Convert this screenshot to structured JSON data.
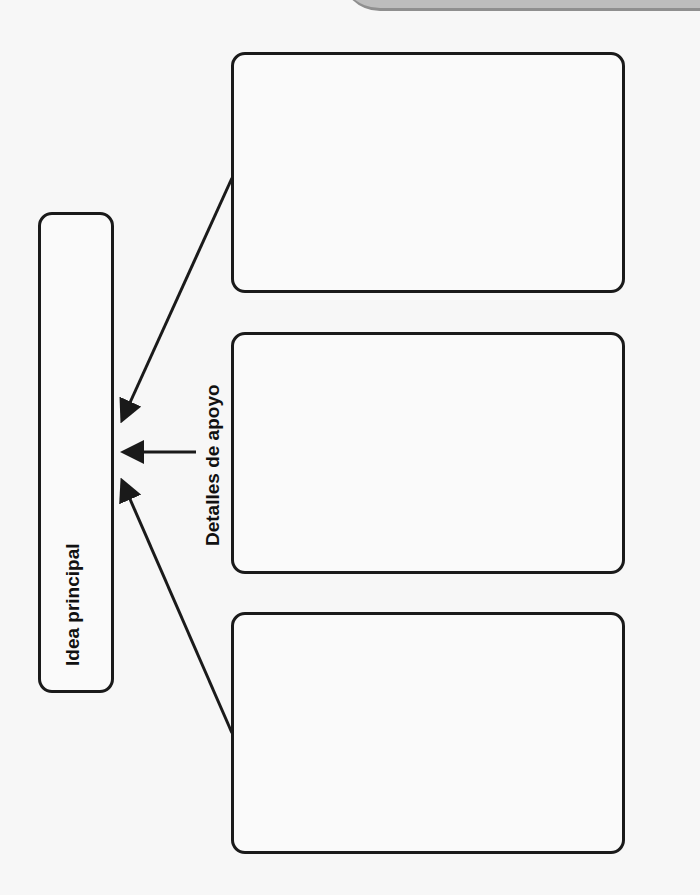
{
  "diagram": {
    "main_idea_label": "Idea principal",
    "details_label": "Detalles de apoyo",
    "detail_boxes": [
      {
        "id": 1,
        "content": ""
      },
      {
        "id": 2,
        "content": ""
      },
      {
        "id": 3,
        "content": ""
      }
    ],
    "colors": {
      "stroke": "#1a1a1a",
      "background": "#f7f7f7",
      "tab": "#bdbdbd"
    }
  }
}
